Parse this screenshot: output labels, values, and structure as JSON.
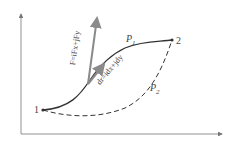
{
  "diagram": {
    "points": [
      {
        "id": "1",
        "label": "1"
      },
      {
        "id": "2",
        "label": "2"
      }
    ],
    "paths": [
      {
        "id": "P1",
        "label": "P",
        "sub": "1",
        "style": "solid"
      },
      {
        "id": "P2",
        "label": "P",
        "sub": "2",
        "style": "dashed"
      }
    ],
    "vectors": {
      "force": {
        "label": "F=iFx+jFy",
        "color": "#888888"
      },
      "displacement": {
        "label": "dr=idx+jdy",
        "color": "#888888"
      }
    },
    "axes": {
      "x": "",
      "y": ""
    },
    "colors": {
      "curve": "#333333",
      "axis": "#777777",
      "vector": "#8a8a8a"
    }
  }
}
